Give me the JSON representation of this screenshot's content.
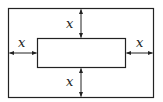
{
  "diagram": {
    "type": "margin-diagram",
    "outer_rect": {
      "x": 8,
      "y": 8,
      "w": 145,
      "h": 89
    },
    "inner_rect": {
      "x": 37,
      "y": 38,
      "w": 88,
      "h": 29
    },
    "stroke_color": "#222222",
    "labels": {
      "top": "x",
      "bottom": "x",
      "left": "x",
      "right": "x"
    }
  }
}
